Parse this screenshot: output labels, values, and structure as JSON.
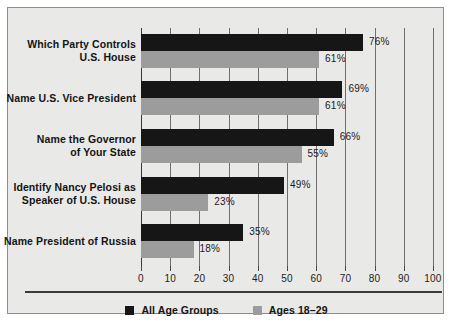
{
  "chart_data": {
    "type": "bar",
    "orientation": "horizontal",
    "title": "",
    "subtitle": "",
    "xlabel": "",
    "ylabel": "",
    "xlim": [
      0,
      100
    ],
    "xticks": [
      0,
      10,
      20,
      30,
      40,
      50,
      60,
      70,
      80,
      90,
      100
    ],
    "xticklabels": [
      "0",
      "10",
      "20",
      "30",
      "40",
      "50",
      "60",
      "70",
      "80",
      "90",
      "100"
    ],
    "grid": true,
    "grid_axis": "x",
    "legend_position": "bottom-center",
    "categories": [
      "Which Party Controls U.S. House",
      "Name U.S. Vice President",
      "Name the Governor of Your State",
      "Identify Nancy Pelosi as Speaker of U.S. House",
      "Name President of Russia"
    ],
    "category_lines": [
      [
        "Which Party Controls",
        "U.S. House"
      ],
      [
        "Name U.S. Vice President"
      ],
      [
        "Name the Governor",
        "of Your State"
      ],
      [
        "Identify Nancy Pelosi as",
        "Speaker of U.S. House"
      ],
      [
        "Name President of Russia"
      ]
    ],
    "series": [
      {
        "name": "All Age Groups",
        "color": "#161616",
        "values": [
          76,
          69,
          66,
          49,
          35
        ],
        "value_labels": [
          "76%",
          "69%",
          "66%",
          "49%",
          "35%"
        ]
      },
      {
        "name": "Ages 18-29",
        "color": "#9c9c9c",
        "values": [
          61,
          61,
          55,
          23,
          18
        ],
        "value_labels": [
          "61%",
          "61%",
          "55%",
          "23%",
          "18%"
        ]
      }
    ]
  },
  "legend": {
    "items": [
      {
        "label": "All Age Groups",
        "color": "#161616"
      },
      {
        "label": "Ages 18–29",
        "color": "#9c9c9c"
      }
    ]
  },
  "colors": {
    "panel_background": "#e9e9e7",
    "page_background": "#ffffff",
    "frame_border": "#8d8d8d",
    "gridline": "#6f6f6f",
    "axis": "#3a3a3a",
    "text": "#141414",
    "series_all_ages": "#161616",
    "series_young": "#9c9c9c"
  }
}
